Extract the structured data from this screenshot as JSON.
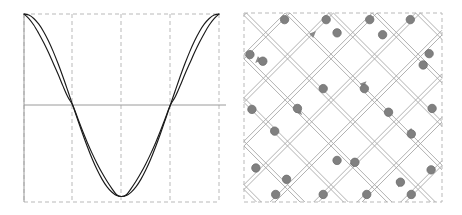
{
  "figure": {
    "title": "",
    "background_color": "#ffffff",
    "panel_count": 2
  },
  "panels": [
    {
      "id": "left",
      "name": "waveform-plot",
      "type": "line-plot"
    },
    {
      "id": "right",
      "name": "lattice-diagram",
      "type": "graph-lattice"
    }
  ],
  "colors": {
    "curve": "#1a1a1a",
    "axis": "#9a9a9a",
    "grid_dashed": "#b9b9b9",
    "node_fill": "#808080",
    "node_stroke": "#6e6e6e",
    "edge": "#a8a8a8",
    "box_dashed": "#b9b9b9",
    "background": "#ffffff"
  },
  "chart_data": [
    {
      "type": "line",
      "title": "",
      "subtitle": "",
      "xlabel": "",
      "ylabel": "",
      "xlim": [
        0,
        1
      ],
      "ylim": [
        -1.06,
        1.0
      ],
      "grid": true,
      "grid_style": "dashed",
      "grid_x": [
        0,
        0.25,
        0.5,
        0.75,
        1.0
      ],
      "grid_y_solid": [
        0.0
      ],
      "legend": "none",
      "xticks": [],
      "yticks": [],
      "series": [
        {
          "name": "cosine",
          "comment": "y = cos(2*pi*x), smooth reference wave",
          "x": [
            0,
            0.025,
            0.05,
            0.075,
            0.1,
            0.125,
            0.15,
            0.175,
            0.2,
            0.225,
            0.25,
            0.275,
            0.3,
            0.325,
            0.35,
            0.375,
            0.4,
            0.425,
            0.45,
            0.475,
            0.5,
            0.525,
            0.55,
            0.575,
            0.6,
            0.625,
            0.65,
            0.675,
            0.7,
            0.725,
            0.75,
            0.775,
            0.8,
            0.825,
            0.85,
            0.875,
            0.9,
            0.925,
            0.95,
            0.975,
            1.0
          ],
          "y": [
            1.0,
            0.988,
            0.951,
            0.891,
            0.809,
            0.707,
            0.588,
            0.454,
            0.309,
            0.156,
            0.0,
            -0.156,
            -0.309,
            -0.454,
            -0.588,
            -0.707,
            -0.809,
            -0.891,
            -0.951,
            -0.988,
            -1.0,
            -0.988,
            -0.951,
            -0.891,
            -0.809,
            -0.707,
            -0.588,
            -0.454,
            -0.309,
            -0.156,
            0.0,
            0.156,
            0.309,
            0.454,
            0.588,
            0.707,
            0.809,
            0.891,
            0.951,
            0.988,
            1.0
          ]
        },
        {
          "name": "distorted-cosine",
          "comment": "steeper-shouldered variant; same zero crossings at x=0.25 and x=0.75, same peaks at x=0,1 and trough at x=0.5",
          "x": [
            0,
            0.025,
            0.05,
            0.075,
            0.1,
            0.125,
            0.15,
            0.175,
            0.2,
            0.225,
            0.25,
            0.275,
            0.3,
            0.325,
            0.35,
            0.375,
            0.4,
            0.425,
            0.45,
            0.475,
            0.5,
            0.525,
            0.55,
            0.575,
            0.6,
            0.625,
            0.65,
            0.675,
            0.7,
            0.725,
            0.75,
            0.775,
            0.8,
            0.825,
            0.85,
            0.875,
            0.9,
            0.925,
            0.95,
            0.975,
            1.0
          ],
          "y": [
            1.0,
            0.95,
            0.88,
            0.79,
            0.69,
            0.58,
            0.46,
            0.34,
            0.21,
            0.09,
            0.0,
            -0.14,
            -0.28,
            -0.41,
            -0.53,
            -0.64,
            -0.74,
            -0.83,
            -0.91,
            -0.98,
            -1.0,
            -0.98,
            -0.91,
            -0.83,
            -0.74,
            -0.64,
            -0.53,
            -0.41,
            -0.28,
            -0.14,
            0.0,
            0.09,
            0.21,
            0.34,
            0.46,
            0.58,
            0.69,
            0.79,
            0.88,
            0.95,
            1.0
          ]
        }
      ]
    },
    {
      "type": "scatter",
      "title": "",
      "xlabel": "",
      "ylabel": "",
      "grid": false,
      "legend": "none",
      "comment": "Diamond / rotated-square lattice. Nodes plotted in normalized panel coordinates 0-1, with directed edge arrowheads.",
      "node_radius": 4.2,
      "nodes": [
        {
          "x": 0.205,
          "y": 0.035
        },
        {
          "x": 0.415,
          "y": 0.035
        },
        {
          "x": 0.635,
          "y": 0.035
        },
        {
          "x": 0.84,
          "y": 0.035
        },
        {
          "x": 0.47,
          "y": 0.105
        },
        {
          "x": 0.7,
          "y": 0.115
        },
        {
          "x": 0.03,
          "y": 0.22
        },
        {
          "x": 0.095,
          "y": 0.255
        },
        {
          "x": 0.935,
          "y": 0.215
        },
        {
          "x": 0.905,
          "y": 0.275
        },
        {
          "x": 0.4,
          "y": 0.4
        },
        {
          "x": 0.608,
          "y": 0.4
        },
        {
          "x": 0.04,
          "y": 0.51
        },
        {
          "x": 0.73,
          "y": 0.525
        },
        {
          "x": 0.95,
          "y": 0.505
        },
        {
          "x": 0.27,
          "y": 0.505
        },
        {
          "x": 0.155,
          "y": 0.625
        },
        {
          "x": 0.845,
          "y": 0.64
        },
        {
          "x": 0.47,
          "y": 0.78
        },
        {
          "x": 0.56,
          "y": 0.79
        },
        {
          "x": 0.06,
          "y": 0.82
        },
        {
          "x": 0.945,
          "y": 0.83
        },
        {
          "x": 0.215,
          "y": 0.88
        },
        {
          "x": 0.79,
          "y": 0.895
        },
        {
          "x": 0.16,
          "y": 0.96
        },
        {
          "x": 0.4,
          "y": 0.96
        },
        {
          "x": 0.62,
          "y": 0.96
        },
        {
          "x": 0.845,
          "y": 0.96
        }
      ],
      "arrow_markers": [
        {
          "x": 0.345,
          "y": 0.115,
          "dir": "up-right"
        },
        {
          "x": 0.075,
          "y": 0.245,
          "dir": "down-left"
        },
        {
          "x": 0.6,
          "y": 0.38,
          "dir": "up-right"
        },
        {
          "x": 0.275,
          "y": 0.52,
          "dir": "down-right"
        },
        {
          "x": 0.84,
          "y": 0.625,
          "dir": "down-right"
        },
        {
          "x": 0.55,
          "y": 0.8,
          "dir": "up-right"
        },
        {
          "x": 0.785,
          "y": 0.905,
          "dir": "up-left"
        }
      ]
    }
  ]
}
